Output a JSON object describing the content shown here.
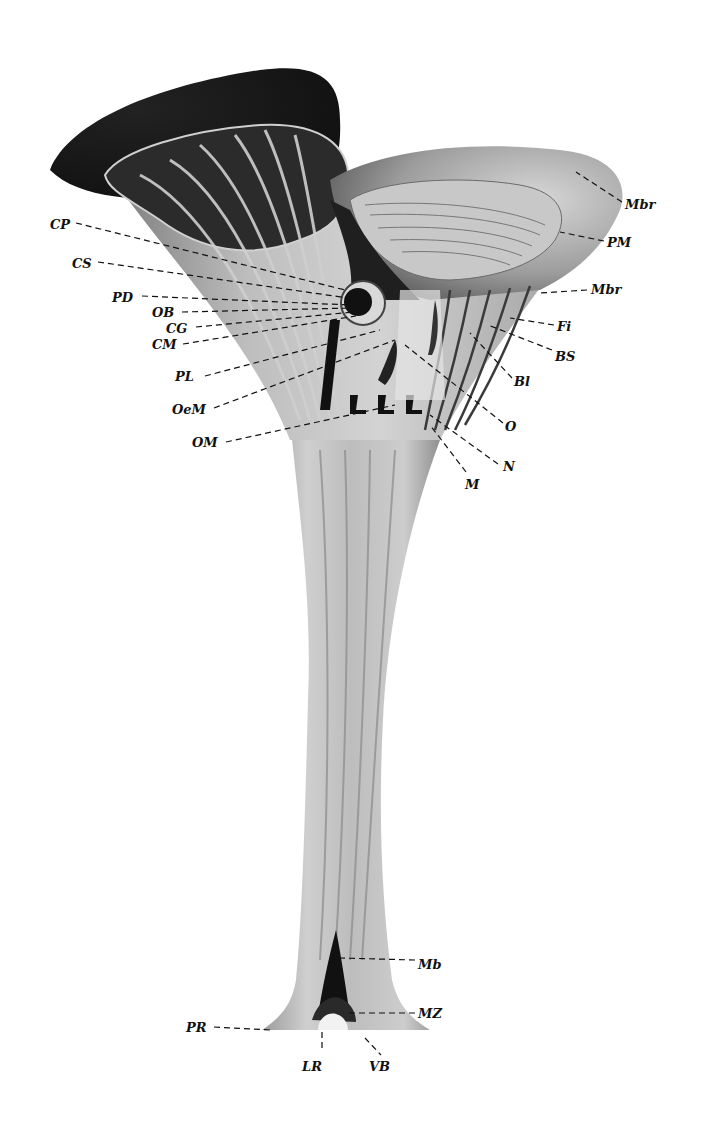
{
  "figure": {
    "type": "anatomical-illustration",
    "colors": {
      "ink": "#111111",
      "dark": "#1a1a1a",
      "mid": "#8a8a8a",
      "light": "#c9c9c9",
      "pale": "#e2e2e2",
      "paper": "#ffffff"
    }
  },
  "labels": [
    {
      "id": "CP",
      "text": "CP",
      "x": 50,
      "y": 218,
      "lx1": 76,
      "ly1": 223,
      "lx2": 345,
      "ly2": 290
    },
    {
      "id": "CS",
      "text": "CS",
      "x": 72,
      "y": 257,
      "lx1": 98,
      "ly1": 262,
      "lx2": 348,
      "ly2": 298
    },
    {
      "id": "PD",
      "text": "PD",
      "x": 112,
      "y": 291,
      "lx1": 142,
      "ly1": 296,
      "lx2": 350,
      "ly2": 305
    },
    {
      "id": "OB",
      "text": "OB",
      "x": 152,
      "y": 306,
      "lx1": 182,
      "ly1": 312,
      "lx2": 352,
      "ly2": 308
    },
    {
      "id": "CG",
      "text": "CG",
      "x": 166,
      "y": 322,
      "lx1": 196,
      "ly1": 327,
      "lx2": 354,
      "ly2": 312
    },
    {
      "id": "CM",
      "text": "CM",
      "x": 152,
      "y": 338,
      "lx1": 183,
      "ly1": 344,
      "lx2": 356,
      "ly2": 316
    },
    {
      "id": "PL",
      "text": "PL",
      "x": 175,
      "y": 370,
      "lx1": 205,
      "ly1": 376,
      "lx2": 380,
      "ly2": 330
    },
    {
      "id": "OeM",
      "text": "OeM",
      "x": 172,
      "y": 403,
      "lx1": 214,
      "ly1": 408,
      "lx2": 395,
      "ly2": 340
    },
    {
      "id": "OM",
      "text": "OM",
      "x": 192,
      "y": 436,
      "lx1": 226,
      "ly1": 442,
      "lx2": 395,
      "ly2": 405
    },
    {
      "id": "Mbr1",
      "text": "Mbr",
      "x": 625,
      "y": 198,
      "lx1": 622,
      "ly1": 202,
      "lx2": 576,
      "ly2": 172
    },
    {
      "id": "PM",
      "text": "PM",
      "x": 607,
      "y": 236,
      "lx1": 604,
      "ly1": 241,
      "lx2": 560,
      "ly2": 232
    },
    {
      "id": "Mbr2",
      "text": "Mbr",
      "x": 591,
      "y": 283,
      "lx1": 587,
      "ly1": 290,
      "lx2": 540,
      "ly2": 293
    },
    {
      "id": "Fi",
      "text": "Fi",
      "x": 557,
      "y": 320,
      "lx1": 554,
      "ly1": 325,
      "lx2": 510,
      "ly2": 318
    },
    {
      "id": "BS",
      "text": "BS",
      "x": 555,
      "y": 350,
      "lx1": 552,
      "ly1": 350,
      "lx2": 488,
      "ly2": 325
    },
    {
      "id": "Bl",
      "text": "Bl",
      "x": 514,
      "y": 375,
      "lx1": 512,
      "ly1": 378,
      "lx2": 470,
      "ly2": 333
    },
    {
      "id": "O",
      "text": "O",
      "x": 505,
      "y": 420,
      "lx1": 503,
      "ly1": 423,
      "lx2": 405,
      "ly2": 345
    },
    {
      "id": "N",
      "text": "N",
      "x": 503,
      "y": 460,
      "lx1": 498,
      "ly1": 464,
      "lx2": 430,
      "ly2": 415
    },
    {
      "id": "M",
      "text": "M",
      "x": 465,
      "y": 478,
      "lx1": 466,
      "ly1": 472,
      "lx2": 430,
      "ly2": 425
    },
    {
      "id": "Mb",
      "text": "Mb",
      "x": 418,
      "y": 958,
      "lx1": 415,
      "ly1": 960,
      "lx2": 340,
      "ly2": 958
    },
    {
      "id": "MZ",
      "text": "MZ",
      "x": 418,
      "y": 1007,
      "lx1": 415,
      "ly1": 1013,
      "lx2": 345,
      "ly2": 1013
    },
    {
      "id": "PR",
      "text": "PR",
      "x": 186,
      "y": 1021,
      "lx1": 214,
      "ly1": 1027,
      "lx2": 270,
      "ly2": 1030
    },
    {
      "id": "LR",
      "text": "LR",
      "x": 302,
      "y": 1060,
      "lx1": 322,
      "ly1": 1032,
      "lx2": 322,
      "ly2": 1048
    },
    {
      "id": "VB",
      "text": "VB",
      "x": 369,
      "y": 1060,
      "lx1": 365,
      "ly1": 1038,
      "lx2": 381,
      "ly2": 1055
    }
  ]
}
